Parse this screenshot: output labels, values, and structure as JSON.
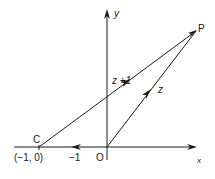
{
  "diagram": {
    "labels": {
      "y_axis": "y",
      "x_axis": "x",
      "point_p": "P",
      "point_c": "C",
      "point_c_coords": "(−1, 0)",
      "minus_one": "−1",
      "origin": "O",
      "vector_z_plus_1": "z +1",
      "vector_z": "z"
    },
    "points": {
      "O": [
        0,
        0
      ],
      "C": [
        -1,
        0
      ],
      "P": "z"
    },
    "vectors": [
      {
        "from": "C",
        "to": "P",
        "label": "z +1"
      },
      {
        "from": "O",
        "to": "P",
        "label": "z"
      },
      {
        "from": "O",
        "to": "C",
        "label": "−1"
      }
    ],
    "colors": {
      "stroke": "#1a1a1a",
      "background": "#ffffff"
    }
  }
}
